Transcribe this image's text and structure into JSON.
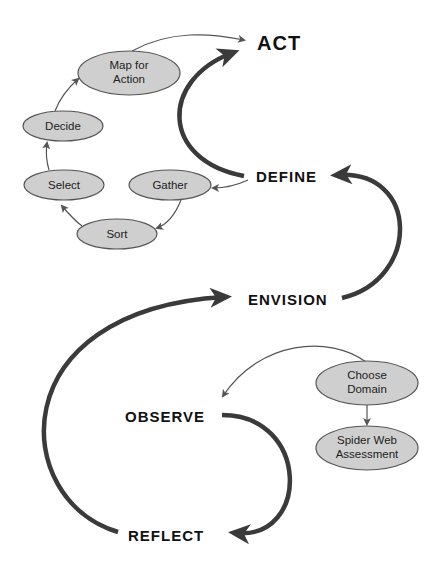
{
  "diagram": {
    "stages": [
      {
        "id": "act",
        "label": "ACT"
      },
      {
        "id": "define",
        "label": "DEFINE"
      },
      {
        "id": "envision",
        "label": "ENVISION"
      },
      {
        "id": "observe",
        "label": "OBSERVE"
      },
      {
        "id": "reflect",
        "label": "REFLECT"
      }
    ],
    "define_subnodes": [
      {
        "id": "map-for-action",
        "lines": [
          "Map for",
          "Action"
        ]
      },
      {
        "id": "decide",
        "lines": [
          "Decide"
        ]
      },
      {
        "id": "select",
        "lines": [
          "Select"
        ]
      },
      {
        "id": "gather",
        "lines": [
          "Gather"
        ]
      },
      {
        "id": "sort",
        "lines": [
          "Sort"
        ]
      }
    ],
    "observe_subnodes": [
      {
        "id": "choose-domain",
        "lines": [
          "Choose",
          "Domain"
        ]
      },
      {
        "id": "spider-web-assessment",
        "lines": [
          "Spider Web",
          "Assessment"
        ]
      }
    ],
    "colors": {
      "node_fill": "#cfcfcf",
      "node_stroke": "#555555",
      "thick_arrow": "#3a3a3a",
      "thin_arrow": "#555555",
      "text": "#111111"
    }
  }
}
